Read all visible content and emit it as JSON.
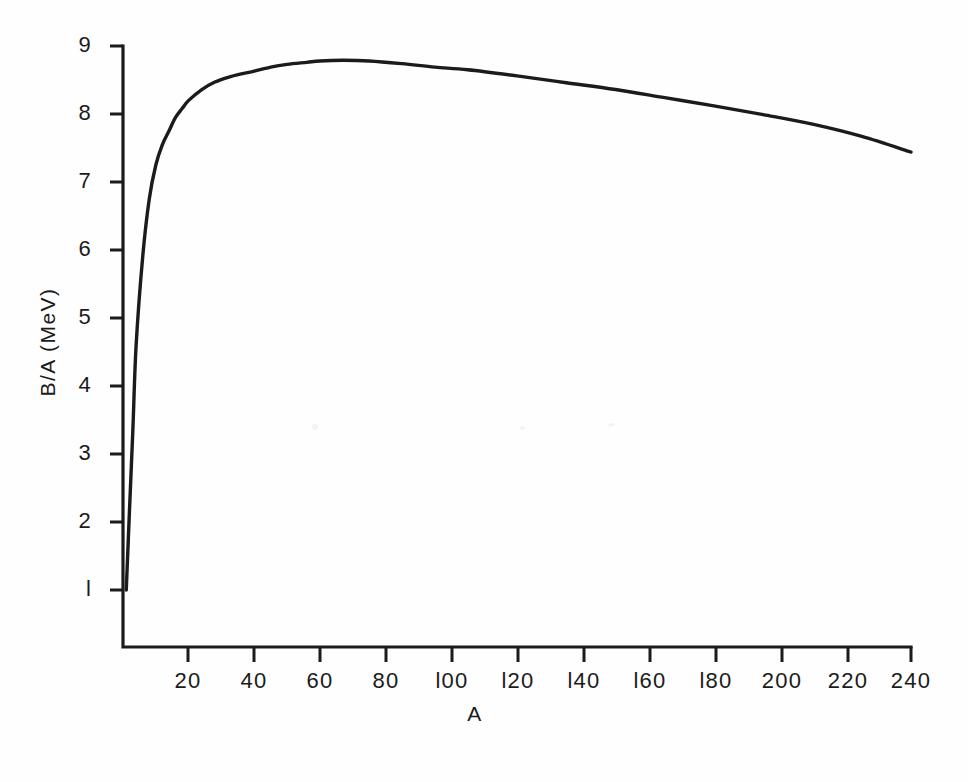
{
  "figure": {
    "background_color": "#fefefe",
    "ink_color": "#1b1b1b"
  },
  "chart_data": {
    "type": "line",
    "title": "",
    "subtitle": "",
    "xlabel": "A",
    "ylabel": "B/A  (MeV)",
    "xlim": [
      0,
      248
    ],
    "ylim": [
      0,
      9.4
    ],
    "grid": false,
    "legend": null,
    "x_ticks": [
      20,
      40,
      60,
      80,
      100,
      120,
      140,
      160,
      180,
      200,
      220,
      240
    ],
    "x_tick_labels": [
      "20",
      "40",
      "60",
      "80",
      "l00",
      "l20",
      "l40",
      "l60",
      "l80",
      "200",
      "220",
      "240"
    ],
    "y_ticks": [
      1,
      2,
      3,
      4,
      5,
      6,
      7,
      8,
      9
    ],
    "y_tick_labels": [
      "l",
      "2",
      "3",
      "4",
      "5",
      "6",
      "7",
      "8",
      "9"
    ],
    "series": [
      {
        "name": "Binding energy per nucleon",
        "x": [
          1,
          2,
          3,
          4,
          6,
          8,
          10,
          12,
          14,
          16,
          18,
          20,
          24,
          28,
          32,
          36,
          40,
          45,
          50,
          56,
          60,
          67,
          75,
          85,
          95,
          105,
          120,
          135,
          150,
          165,
          180,
          195,
          210,
          225,
          240
        ],
        "y": [
          1.0,
          2.2,
          3.35,
          4.6,
          5.9,
          6.75,
          7.25,
          7.55,
          7.75,
          7.95,
          8.08,
          8.2,
          8.36,
          8.47,
          8.54,
          8.59,
          8.63,
          8.69,
          8.73,
          8.76,
          8.78,
          8.79,
          8.78,
          8.74,
          8.69,
          8.65,
          8.56,
          8.46,
          8.36,
          8.24,
          8.12,
          7.99,
          7.85,
          7.67,
          7.44
        ]
      }
    ],
    "annotations": []
  }
}
